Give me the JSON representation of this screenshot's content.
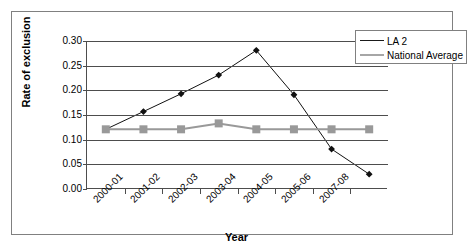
{
  "chart_data": {
    "type": "line",
    "title": "",
    "xlabel": "Year",
    "ylabel": "Rate of exclusion",
    "categories": [
      "2000-01",
      "2001-02",
      "2002-03",
      "2003-04",
      "2004-05",
      "2005-06",
      "2006-07",
      "2007-08"
    ],
    "xtick_labels": [
      "2000-01",
      "2001-02",
      "2002-03",
      "2003-04",
      "2004-05",
      "2005-06",
      "2007-08"
    ],
    "ytick_labels": [
      "0.00",
      "0.05",
      "0.10",
      "0.15",
      "0.20",
      "0.25",
      "0.30"
    ],
    "ylim": [
      0.0,
      0.3
    ],
    "ytick_step": 0.05,
    "grid": "horizontal",
    "legend_position": "top-right",
    "series": [
      {
        "name": "LA 2",
        "marker": "diamond",
        "color": "#111111",
        "values": [
          0.121,
          0.157,
          0.193,
          0.231,
          0.281,
          0.191,
          0.081,
          0.03
        ]
      },
      {
        "name": "National Average",
        "marker": "square",
        "color": "#999999",
        "values": [
          0.121,
          0.121,
          0.121,
          0.133,
          0.121,
          0.121,
          0.121,
          0.121
        ]
      }
    ]
  },
  "legend": {
    "items": [
      {
        "label": "LA 2"
      },
      {
        "label": "National Average"
      }
    ]
  },
  "axes": {
    "y_title": "Rate of exclusion",
    "x_title": "Year"
  }
}
